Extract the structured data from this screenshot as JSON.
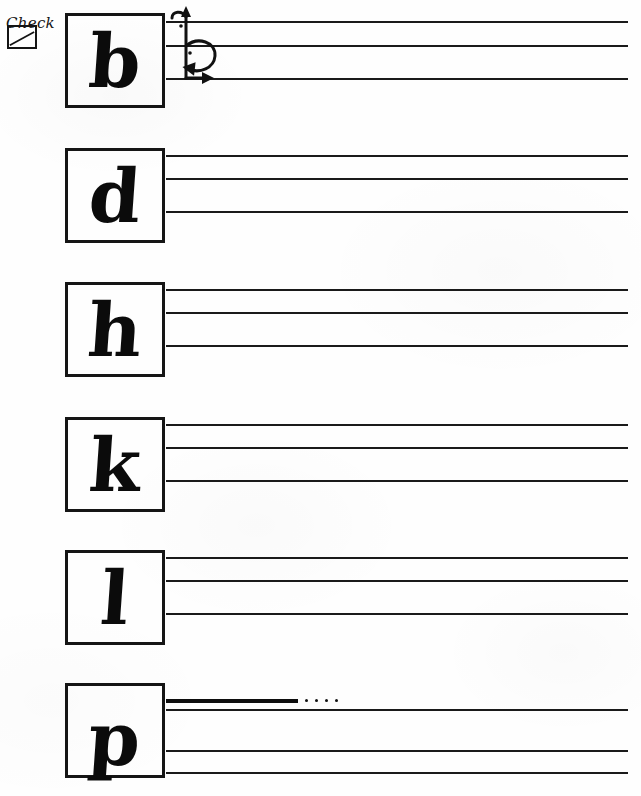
{
  "worksheet": {
    "title": "Calligraphy ascender letters practice sheet",
    "legend": {
      "label": "Check",
      "icon": "checkbox-diagonal-icon"
    },
    "stroke_diagram": {
      "name": "letter-b-stroke-order-diagram",
      "letter": "b",
      "strokes": 2,
      "stroke_notes": [
        "upward ascender stroke",
        "clockwise bowl loop"
      ]
    },
    "rows": [
      {
        "letter": "b",
        "box": {
          "top": 13,
          "left": 65,
          "width": 100,
          "height": 95
        },
        "has_stroke_diagram": true,
        "descender": false,
        "lines": [
          {
            "y": 21,
            "style": "normal"
          },
          {
            "y": 45,
            "style": "normal"
          },
          {
            "y": 78,
            "style": "normal"
          }
        ]
      },
      {
        "letter": "d",
        "box": {
          "top": 148,
          "left": 65,
          "width": 100,
          "height": 95
        },
        "has_stroke_diagram": false,
        "descender": false,
        "lines": [
          {
            "y": 155,
            "style": "normal"
          },
          {
            "y": 178,
            "style": "normal"
          },
          {
            "y": 211,
            "style": "normal"
          }
        ]
      },
      {
        "letter": "h",
        "box": {
          "top": 282,
          "left": 65,
          "width": 100,
          "height": 95
        },
        "has_stroke_diagram": false,
        "descender": false,
        "lines": [
          {
            "y": 289,
            "style": "normal"
          },
          {
            "y": 312,
            "style": "normal"
          },
          {
            "y": 345,
            "style": "normal"
          }
        ]
      },
      {
        "letter": "k",
        "box": {
          "top": 417,
          "left": 65,
          "width": 100,
          "height": 95
        },
        "has_stroke_diagram": false,
        "descender": false,
        "lines": [
          {
            "y": 424,
            "style": "normal"
          },
          {
            "y": 447,
            "style": "normal"
          },
          {
            "y": 480,
            "style": "normal"
          }
        ]
      },
      {
        "letter": "l",
        "box": {
          "top": 550,
          "left": 65,
          "width": 100,
          "height": 95
        },
        "has_stroke_diagram": false,
        "descender": false,
        "lines": [
          {
            "y": 557,
            "style": "normal"
          },
          {
            "y": 580,
            "style": "normal"
          },
          {
            "y": 613,
            "style": "normal"
          }
        ]
      },
      {
        "letter": "p",
        "box": {
          "top": 683,
          "left": 65,
          "width": 100,
          "height": 95
        },
        "has_stroke_diagram": false,
        "descender": true,
        "lines": [
          {
            "y": 699,
            "style": "thick-with-dots"
          },
          {
            "y": 709,
            "style": "normal"
          },
          {
            "y": 750,
            "style": "normal"
          },
          {
            "y": 772,
            "style": "normal"
          }
        ]
      }
    ],
    "colors": {
      "ink": "#111111",
      "paper": "#fefefe",
      "rule": "#1a1a1a"
    }
  }
}
